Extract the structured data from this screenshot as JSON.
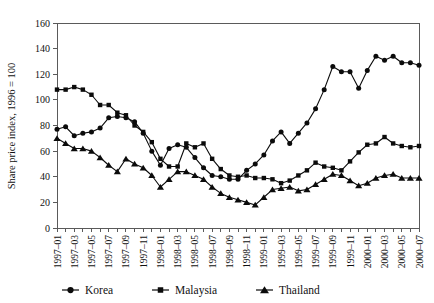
{
  "chart_data": {
    "type": "line",
    "title": "",
    "subtitle": "",
    "xlabel": "",
    "ylabel": "Share price index, 1996 = 100",
    "ylim": [
      0,
      160
    ],
    "yticks": [
      0,
      20,
      40,
      60,
      80,
      100,
      120,
      140,
      160
    ],
    "grid": false,
    "legend_position": "bottom",
    "x": [
      "1997-01",
      "1997-02",
      "1997-03",
      "1997-04",
      "1997-05",
      "1997-06",
      "1997-07",
      "1997-08",
      "1997-09",
      "1997-10",
      "1997-11",
      "1997-12",
      "1998-01",
      "1998-02",
      "1998-03",
      "1998-04",
      "1998-05",
      "1998-06",
      "1998-07",
      "1998-08",
      "1998-09",
      "1998-10",
      "1998-11",
      "1998-12",
      "1999-01",
      "1999-02",
      "1999-03",
      "1999-04",
      "1999-05",
      "1999-06",
      "1999-07",
      "1999-08",
      "1999-09",
      "1999-10",
      "1999-11",
      "1999-12",
      "2000-01",
      "2000-02",
      "2000-03",
      "2000-04",
      "2000-05",
      "2000-06",
      "2000-07"
    ],
    "xtick_labels": [
      "1997–01",
      "1997–03",
      "1997–05",
      "1997–07",
      "1997–09",
      "1997–11",
      "1998–01",
      "1998–03",
      "1998–05",
      "1998–07",
      "1998–09",
      "1998–11",
      "1999–01",
      "1999–03",
      "1999–05",
      "1999–07",
      "1999–09",
      "1999–11",
      "2000–01",
      "2000–03",
      "2000–05",
      "2000–07"
    ],
    "series": [
      {
        "name": "Korea",
        "marker": "circle",
        "values": [
          77,
          79,
          72,
          74,
          75,
          78,
          86,
          87,
          86,
          83,
          74,
          60,
          49,
          62,
          65,
          63,
          55,
          47,
          41,
          40,
          38,
          38,
          45,
          50,
          57,
          68,
          75,
          66,
          74,
          82,
          93,
          108,
          126,
          122,
          122,
          109,
          123,
          134,
          131,
          134,
          129,
          129,
          127
        ]
      },
      {
        "name": "Malaysia",
        "marker": "square",
        "values": [
          108,
          108,
          110,
          108,
          104,
          96,
          96,
          90,
          88,
          80,
          75,
          67,
          54,
          48,
          48,
          66,
          63,
          66,
          54,
          46,
          41,
          40,
          41,
          39,
          39,
          38,
          35,
          37,
          41,
          45,
          51,
          48,
          47,
          45,
          52,
          59,
          65,
          66,
          71,
          66,
          64,
          63,
          64
        ]
      },
      {
        "name": "Thailand",
        "marker": "triangle",
        "values": [
          70,
          66,
          62,
          62,
          60,
          55,
          49,
          44,
          54,
          50,
          47,
          41,
          32,
          38,
          44,
          44,
          41,
          38,
          32,
          27,
          24,
          22,
          20,
          18,
          24,
          30,
          31,
          32,
          29,
          30,
          34,
          38,
          42,
          41,
          37,
          33,
          35,
          39,
          41,
          42,
          39,
          39,
          39
        ]
      }
    ]
  },
  "legend": {
    "items": [
      {
        "label": "Korea"
      },
      {
        "label": "Malaysia"
      },
      {
        "label": "Thailand"
      }
    ]
  }
}
